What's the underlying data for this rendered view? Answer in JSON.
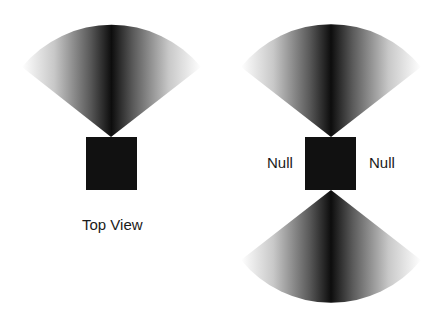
{
  "diagrams": [
    {
      "caption": "Top View",
      "fans": [
        "up"
      ],
      "labels": []
    },
    {
      "caption": "",
      "fans": [
        "up",
        "down"
      ],
      "labels": [
        "Null",
        "Null"
      ]
    }
  ],
  "colors": {
    "background": "#ffffff",
    "source_box": "#111111",
    "beam_core": "#0d0d0d",
    "beam_edge": "#ffffff",
    "text": "#1a1a1a"
  }
}
